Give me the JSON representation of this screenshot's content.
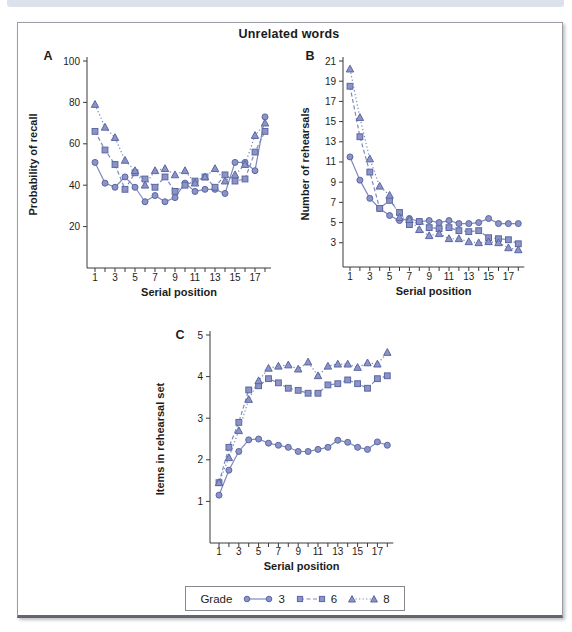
{
  "figure": {
    "title": "Unrelated words"
  },
  "colors": {
    "line": "#7e89bd",
    "marker_fill": "#8b94c5",
    "marker_stroke": "#5b67a4",
    "axis": "#3a3a3a",
    "text": "#1c1c1c",
    "topbar": "#dce1ec"
  },
  "legend": {
    "title": "Grade",
    "position": "bottom-center",
    "entries": [
      {
        "label": "3",
        "marker": "circle",
        "line": "solid"
      },
      {
        "label": "6",
        "marker": "square",
        "line": "dashed"
      },
      {
        "label": "8",
        "marker": "triangle",
        "line": "dotted"
      }
    ]
  },
  "chart_data": [
    {
      "id": "A",
      "type": "line",
      "panel_label": "A",
      "xlabel": "Serial position",
      "ylabel": "Probability of recall",
      "x": [
        1,
        2,
        3,
        4,
        5,
        6,
        7,
        8,
        9,
        10,
        11,
        12,
        13,
        14,
        15,
        16,
        17,
        18
      ],
      "xtick_labels": [
        1,
        3,
        5,
        7,
        9,
        11,
        13,
        15,
        17
      ],
      "ylim": [
        0,
        100
      ],
      "yticks": [
        20,
        40,
        60,
        80,
        100
      ],
      "grid": false,
      "series": [
        {
          "name": "Grade 3",
          "marker": "circle",
          "line": "solid",
          "values": [
            51,
            41,
            39,
            44,
            39,
            32,
            35,
            32,
            34,
            41,
            37,
            38,
            38,
            36,
            51,
            51,
            47,
            73
          ]
        },
        {
          "name": "Grade 6",
          "marker": "square",
          "line": "dashed",
          "values": [
            66,
            57,
            50,
            38,
            46,
            43,
            39,
            44,
            37,
            40,
            42,
            44,
            39,
            45,
            42,
            43,
            56,
            66
          ]
        },
        {
          "name": "Grade 8",
          "marker": "triangle",
          "line": "dotted",
          "values": [
            79,
            68,
            63,
            52,
            47,
            40,
            47,
            48,
            45,
            47,
            41,
            44,
            48,
            42,
            45,
            50,
            64,
            70
          ]
        }
      ]
    },
    {
      "id": "B",
      "type": "line",
      "panel_label": "B",
      "xlabel": "Serial position",
      "ylabel": "Number of rehearsals",
      "x": [
        1,
        2,
        3,
        4,
        5,
        6,
        7,
        8,
        9,
        10,
        11,
        12,
        13,
        14,
        15,
        16,
        17,
        18
      ],
      "xtick_labels": [
        1,
        3,
        5,
        7,
        9,
        11,
        13,
        15,
        17
      ],
      "ylim": [
        0.6,
        21
      ],
      "yticks": [
        3,
        5,
        7,
        9,
        11,
        13,
        15,
        17,
        19,
        21
      ],
      "grid": false,
      "series": [
        {
          "name": "Grade 3",
          "marker": "circle",
          "line": "solid",
          "values": [
            11.5,
            9.2,
            7.4,
            6.4,
            5.7,
            5.2,
            5.4,
            5.1,
            5.2,
            5.0,
            5.2,
            4.9,
            4.9,
            5.0,
            5.4,
            4.9,
            4.9,
            4.9
          ]
        },
        {
          "name": "Grade 6",
          "marker": "square",
          "line": "dashed",
          "values": [
            18.5,
            13.5,
            10.0,
            6.4,
            7.2,
            6.0,
            4.8,
            5.1,
            4.5,
            4.4,
            4.5,
            4.2,
            4.1,
            4.2,
            3.5,
            3.4,
            3.3,
            2.9
          ]
        },
        {
          "name": "Grade 8",
          "marker": "triangle",
          "line": "dotted",
          "values": [
            20.2,
            15.4,
            11.3,
            8.6,
            7.7,
            5.5,
            5.3,
            4.3,
            3.7,
            3.9,
            3.4,
            3.4,
            3.1,
            3.0,
            3.1,
            3.0,
            2.5,
            2.3
          ]
        }
      ]
    },
    {
      "id": "C",
      "type": "line",
      "panel_label": "C",
      "xlabel": "Serial position",
      "ylabel": "Items in rehearsal set",
      "x": [
        1,
        2,
        3,
        4,
        5,
        6,
        7,
        8,
        9,
        10,
        11,
        12,
        13,
        14,
        15,
        16,
        17,
        18
      ],
      "xtick_labels": [
        1,
        3,
        5,
        7,
        9,
        11,
        13,
        15,
        17
      ],
      "ylim": [
        0,
        5
      ],
      "yticks": [
        1,
        2,
        3,
        4,
        5
      ],
      "grid": false,
      "series": [
        {
          "name": "Grade 3",
          "marker": "circle",
          "line": "solid",
          "values": [
            1.15,
            1.75,
            2.2,
            2.48,
            2.5,
            2.4,
            2.35,
            2.3,
            2.2,
            2.2,
            2.25,
            2.3,
            2.47,
            2.42,
            2.3,
            2.25,
            2.43,
            2.35
          ]
        },
        {
          "name": "Grade 6",
          "marker": "square",
          "line": "dashed",
          "values": [
            1.45,
            2.3,
            2.9,
            3.68,
            3.78,
            3.95,
            3.85,
            3.72,
            3.67,
            3.6,
            3.6,
            3.8,
            3.83,
            3.92,
            3.83,
            3.72,
            3.95,
            4.02
          ]
        },
        {
          "name": "Grade 8",
          "marker": "triangle",
          "line": "dotted",
          "values": [
            1.45,
            2.05,
            2.7,
            3.45,
            3.9,
            4.2,
            4.25,
            4.28,
            4.18,
            4.35,
            4.02,
            4.25,
            4.3,
            4.3,
            4.22,
            4.33,
            4.3,
            4.58
          ]
        }
      ]
    }
  ]
}
